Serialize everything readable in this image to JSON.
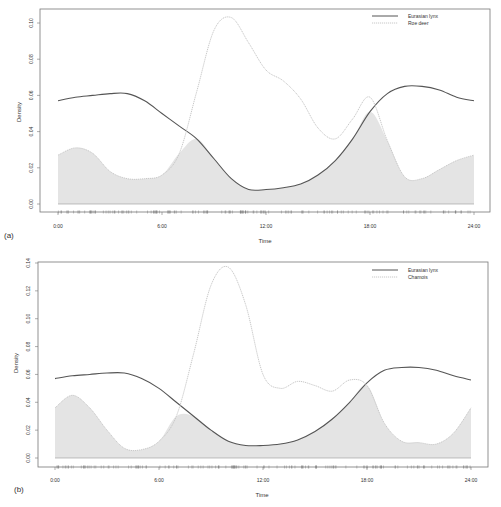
{
  "chart_data": [
    {
      "panel_label": "(a)",
      "type": "area",
      "title": "",
      "xlabel": "Time",
      "ylabel": "Density",
      "x_ticks": [
        "0:00",
        "6:00",
        "12:00",
        "18:00",
        "24:00"
      ],
      "y_ticks": [
        "0.00",
        "0.02",
        "0.04",
        "0.06",
        "0.08",
        "0.10"
      ],
      "xlim": [
        0,
        24
      ],
      "ylim": [
        0,
        0.1
      ],
      "grid": false,
      "legend_position": "top-right",
      "legend": [
        {
          "label": "Eurasian lynx",
          "style": "solid",
          "color": "#555555"
        },
        {
          "label": "Roe deer",
          "style": "dotted",
          "color": "#c8c8c8"
        }
      ],
      "overlap_fill_color": "#e4e4e4",
      "x": [
        0,
        1,
        2,
        3,
        4,
        5,
        6,
        7,
        8,
        9,
        10,
        11,
        12,
        13,
        14,
        15,
        16,
        17,
        18,
        19,
        20,
        21,
        22,
        23,
        24
      ],
      "series": [
        {
          "name": "Eurasian lynx",
          "values": [
            0.057,
            0.059,
            0.06,
            0.061,
            0.061,
            0.057,
            0.05,
            0.043,
            0.036,
            0.025,
            0.014,
            0.008,
            0.008,
            0.009,
            0.011,
            0.016,
            0.024,
            0.036,
            0.051,
            0.061,
            0.065,
            0.065,
            0.063,
            0.059,
            0.057
          ]
        },
        {
          "name": "Roe deer",
          "values": [
            0.027,
            0.031,
            0.028,
            0.018,
            0.014,
            0.014,
            0.016,
            0.028,
            0.062,
            0.096,
            0.103,
            0.089,
            0.074,
            0.068,
            0.058,
            0.042,
            0.036,
            0.047,
            0.059,
            0.035,
            0.015,
            0.014,
            0.019,
            0.024,
            0.027
          ]
        }
      ]
    },
    {
      "panel_label": "(b)",
      "type": "area",
      "title": "",
      "xlabel": "Time",
      "ylabel": "Density",
      "x_ticks": [
        "0:00",
        "6:00",
        "12:00",
        "18:00",
        "24:00"
      ],
      "y_ticks": [
        "0.00",
        "0.02",
        "0.04",
        "0.06",
        "0.08",
        "0.10",
        "0.12",
        "0.14"
      ],
      "xlim": [
        0,
        24
      ],
      "ylim": [
        0,
        0.14
      ],
      "grid": false,
      "legend_position": "top-right",
      "legend": [
        {
          "label": "Eurasian lynx",
          "style": "solid",
          "color": "#555555"
        },
        {
          "label": "Chamois",
          "style": "dotted",
          "color": "#c8c8c8"
        }
      ],
      "overlap_fill_color": "#e4e4e4",
      "x": [
        0,
        1,
        2,
        3,
        4,
        5,
        6,
        7,
        8,
        9,
        10,
        11,
        12,
        13,
        14,
        15,
        16,
        17,
        18,
        19,
        20,
        21,
        22,
        23,
        24
      ],
      "series": [
        {
          "name": "Eurasian lynx",
          "values": [
            0.057,
            0.059,
            0.06,
            0.061,
            0.061,
            0.057,
            0.05,
            0.04,
            0.03,
            0.02,
            0.012,
            0.009,
            0.009,
            0.01,
            0.013,
            0.019,
            0.028,
            0.04,
            0.054,
            0.063,
            0.065,
            0.065,
            0.063,
            0.059,
            0.056
          ]
        },
        {
          "name": "Chamois",
          "values": [
            0.036,
            0.045,
            0.036,
            0.02,
            0.007,
            0.006,
            0.012,
            0.03,
            0.075,
            0.124,
            0.137,
            0.11,
            0.06,
            0.05,
            0.055,
            0.052,
            0.048,
            0.056,
            0.052,
            0.025,
            0.012,
            0.011,
            0.01,
            0.018,
            0.036
          ]
        }
      ]
    }
  ]
}
